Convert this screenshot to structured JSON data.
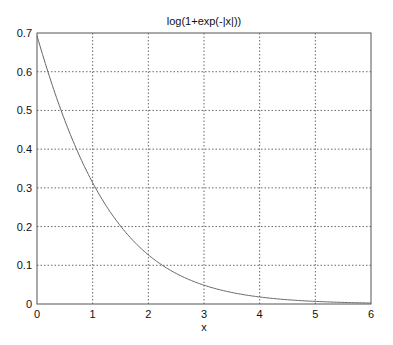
{
  "chart_data": {
    "type": "line",
    "title": "log(1+exp(-|x|))",
    "xlabel": "x",
    "ylabel": "",
    "xlim": [
      0,
      6
    ],
    "ylim": [
      0,
      0.7
    ],
    "grid": true,
    "xticks": [
      "0",
      "1",
      "2",
      "3",
      "4",
      "5",
      "6"
    ],
    "yticks": [
      "0",
      "0.1",
      "0.2",
      "0.3",
      "0.4",
      "0.5",
      "0.6",
      "0.7"
    ],
    "series": [
      {
        "name": "log(1+exp(-|x|))",
        "x": [
          0,
          0.25,
          0.5,
          0.75,
          1,
          1.25,
          1.5,
          1.75,
          2,
          2.25,
          2.5,
          2.75,
          3,
          3.25,
          3.5,
          3.75,
          4,
          4.5,
          5,
          5.5,
          6
        ],
        "values": [
          0.693,
          0.576,
          0.474,
          0.386,
          0.313,
          0.251,
          0.201,
          0.16,
          0.127,
          0.1,
          0.079,
          0.062,
          0.049,
          0.038,
          0.03,
          0.023,
          0.018,
          0.011,
          0.007,
          0.004,
          0.002
        ]
      }
    ]
  }
}
